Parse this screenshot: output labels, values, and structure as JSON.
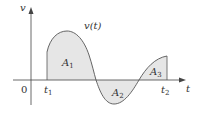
{
  "diagram": {
    "title": "",
    "axes": {
      "y_label": "v",
      "x_label": "t",
      "origin_label": "0"
    },
    "curve_label": "v(t)",
    "ticks": [
      {
        "name": "t",
        "sub": "1"
      },
      {
        "name": "t",
        "sub": "2"
      }
    ],
    "regions": [
      {
        "name": "A",
        "sub": "1",
        "sign": "positive"
      },
      {
        "name": "A",
        "sub": "2",
        "sign": "negative"
      },
      {
        "name": "A",
        "sub": "3",
        "sign": "positive"
      }
    ],
    "colors": {
      "fill": "#e6e6e6",
      "stroke": "#555555",
      "axis": "#444444",
      "background": "#ffffff"
    }
  }
}
